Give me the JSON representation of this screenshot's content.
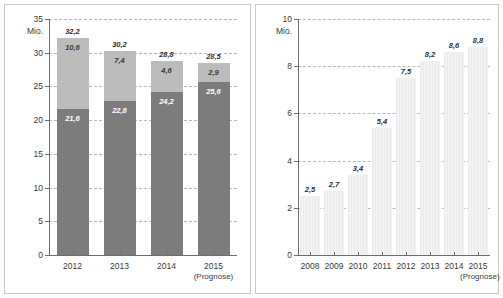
{
  "chart_data": [
    {
      "name": "left",
      "type": "bar",
      "stacked": true,
      "title": "",
      "xlabel": "",
      "ylabel": "Mio.",
      "unit": "Mio.",
      "ylim": [
        0,
        35
      ],
      "yticks": [
        0,
        5,
        10,
        15,
        20,
        25,
        30,
        35
      ],
      "ytick_labels": [
        "0",
        "5",
        "10",
        "15",
        "20",
        "25",
        "30",
        "35"
      ],
      "grid": true,
      "legend": "none",
      "categories": [
        "2012",
        "2013",
        "2014",
        "2015"
      ],
      "category_sublabels": [
        "",
        "",
        "",
        "(Prognose)"
      ],
      "series": [
        {
          "name": "bottom",
          "color": "#7c7c7c",
          "values": [
            21.6,
            22.8,
            24.2,
            25.6
          ],
          "labels": [
            "21,6",
            "22,8",
            "24,2",
            "25,6"
          ]
        },
        {
          "name": "top",
          "color": "#bcbcbc",
          "values": [
            10.6,
            7.4,
            4.6,
            2.9
          ],
          "labels": [
            "10,6",
            "7,4",
            "4,6",
            "2,9"
          ]
        }
      ],
      "totals": [
        32.2,
        30.2,
        28.8,
        28.5
      ],
      "total_labels": [
        "32,2",
        "30,2",
        "28,8",
        "28,5"
      ]
    },
    {
      "name": "right",
      "type": "bar",
      "stacked": false,
      "title": "",
      "xlabel": "",
      "ylabel": "Mio.",
      "unit": "Mio.",
      "ylim": [
        0,
        10
      ],
      "yticks": [
        0,
        2,
        4,
        6,
        8,
        10
      ],
      "ytick_labels": [
        "0",
        "2",
        "4",
        "6",
        "8",
        "10"
      ],
      "grid": true,
      "legend": "none",
      "categories": [
        "2008",
        "2009",
        "2010",
        "2011",
        "2012",
        "2013",
        "2014",
        "2015"
      ],
      "category_sublabels": [
        "",
        "",
        "",
        "",
        "",
        "",
        "",
        "(Prognose)"
      ],
      "values": [
        2.5,
        2.7,
        3.4,
        5.4,
        7.5,
        8.2,
        8.6,
        8.8
      ],
      "value_labels": [
        "2,5",
        "2,7",
        "3,4",
        "5,4",
        "7,5",
        "8,2",
        "8,6",
        "8,8"
      ],
      "bar_color": "#ededed"
    }
  ],
  "colors": {
    "bar_dark": "#7c7c7c",
    "bar_mid": "#bcbcbc",
    "bar_light": "#ededed",
    "axis": "#6e6e6e",
    "grid": "#b9b9b9",
    "frame": "#c9c9c9",
    "text": "#3a3a3a"
  }
}
